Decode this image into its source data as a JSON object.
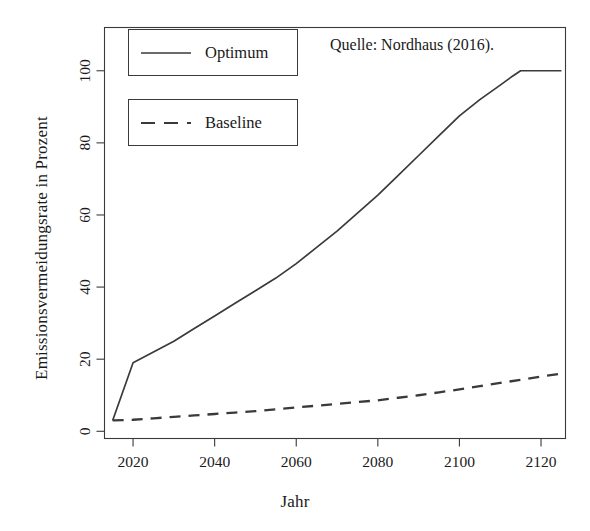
{
  "chart_data": {
    "type": "line",
    "title": "",
    "xlabel": "Jahr",
    "ylabel": "Emissionsvermeidungsrate in Prozent",
    "xlim": [
      2013,
      2126
    ],
    "ylim": [
      -2,
      112
    ],
    "xticks": [
      "2020",
      "2040",
      "2060",
      "2080",
      "2100",
      "2120"
    ],
    "xtick_values": [
      2020,
      2040,
      2060,
      2080,
      2100,
      2120
    ],
    "yticks": [
      "0",
      "20",
      "40",
      "60",
      "80",
      "100"
    ],
    "ytick_values": [
      0,
      20,
      40,
      60,
      80,
      100
    ],
    "grid": false,
    "legend_position": "top-left",
    "annotations": [
      {
        "name": "source-note",
        "text": "Quelle: Nordhaus (2016)."
      }
    ],
    "series": [
      {
        "name": "Optimum",
        "style": "solid",
        "color": "#3a3a3a",
        "x": [
          2015,
          2020,
          2025,
          2030,
          2035,
          2040,
          2045,
          2050,
          2055,
          2060,
          2065,
          2070,
          2075,
          2080,
          2085,
          2090,
          2095,
          2100,
          2105,
          2110,
          2113,
          2115,
          2120,
          2125
        ],
        "values": [
          3.0,
          19.0,
          22.0,
          25.0,
          28.5,
          32.0,
          35.5,
          39.0,
          42.5,
          46.5,
          51.0,
          55.5,
          60.5,
          65.5,
          71.0,
          76.5,
          82.0,
          87.5,
          92.0,
          96.0,
          98.5,
          100.0,
          100.0,
          100.0
        ]
      },
      {
        "name": "Baseline",
        "style": "dashed",
        "color": "#3a3a3a",
        "x": [
          2015,
          2020,
          2025,
          2030,
          2035,
          2040,
          2045,
          2050,
          2055,
          2060,
          2065,
          2070,
          2075,
          2080,
          2085,
          2090,
          2095,
          2100,
          2105,
          2110,
          2115,
          2120,
          2125
        ],
        "values": [
          3.0,
          3.2,
          3.6,
          4.0,
          4.4,
          4.8,
          5.2,
          5.6,
          6.1,
          6.6,
          7.1,
          7.6,
          8.1,
          8.6,
          9.3,
          10.0,
          10.8,
          11.6,
          12.5,
          13.4,
          14.3,
          15.2,
          16.0
        ]
      }
    ]
  },
  "legend": {
    "items": [
      {
        "label": "Optimum",
        "style": "solid"
      },
      {
        "label": "Baseline",
        "style": "dashed"
      }
    ]
  },
  "axes": {
    "x_title": "Jahr",
    "y_title": "Emissionsvermeidungsrate in Prozent"
  },
  "colors": {
    "line": "#3a3a3a",
    "frame": "#3a3a3a",
    "text": "#1a1a1a",
    "background": "#ffffff"
  }
}
